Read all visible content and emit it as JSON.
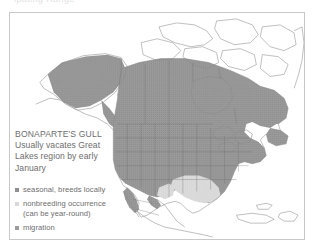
{
  "cut_off_heading": "ipating Range",
  "figure": {
    "caption": {
      "species": "BONAPARTE'S GULL",
      "line1": "Usually vacates Great",
      "line2": "Lakes region by early",
      "line3": "January"
    },
    "legend": {
      "items": [
        {
          "marker": "square-swatch-icon",
          "label": "seasonal, breeds locally",
          "color": "#8f8f8f"
        },
        {
          "marker": "square-swatch-icon",
          "label": "nonbreeding occurrence",
          "label_line2": "(can be year-round)",
          "color": "#d8d8d8"
        },
        {
          "marker": "square-swatch-icon",
          "label": "migration",
          "color": "#9d9d9d"
        }
      ]
    },
    "map": {
      "region": "North America",
      "ocean_color": "#ffffff",
      "land_outline_color": "#8a8a8a",
      "breeding_fill": "#9a9a9a",
      "nonbreeding_fill": "#dcdcdc",
      "border_color": "#c9c9c9"
    }
  }
}
